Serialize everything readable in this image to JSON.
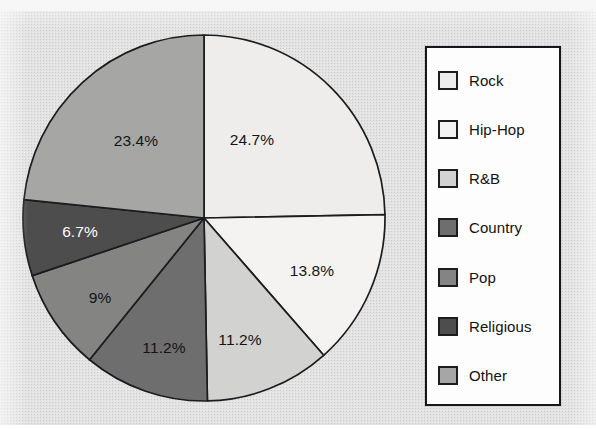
{
  "chart_data": {
    "type": "pie",
    "title": "",
    "legend_position": "right",
    "start_angle_deg": 0,
    "direction": "clockwise",
    "categories": [
      "Rock",
      "Hip-Hop",
      "R&B",
      "Country",
      "Pop",
      "Religious",
      "Other"
    ],
    "values": [
      24.7,
      13.8,
      11.2,
      11.2,
      9,
      6.7,
      23.4
    ],
    "slice_labels": [
      "24.7%",
      "13.8%",
      "11.2%",
      "11.2%",
      "9%",
      "6.7%",
      "23.4%"
    ],
    "slice_colors": [
      "#eeedec",
      "#f4f3f2",
      "#d2d2d1",
      "#6e6e6e",
      "#848483",
      "#4d4d4d",
      "#a6a6a5"
    ],
    "slice_label_colors": [
      "#141414",
      "#141414",
      "#141414",
      "#141414",
      "#141414",
      "#ffffff",
      "#141414"
    ],
    "units": "percent",
    "total": 100
  },
  "pie": {
    "slices": [
      {
        "name": "Rock",
        "label": "24.7%",
        "value": 24.7,
        "color": "#eeedec",
        "label_color": "dark",
        "label_x": 252,
        "label_y": 140
      },
      {
        "name": "Hip-Hop",
        "label": "13.8%",
        "value": 13.8,
        "color": "#f4f3f2",
        "label_color": "dark",
        "label_x": 312,
        "label_y": 271
      },
      {
        "name": "R&B",
        "label": "11.2%",
        "value": 11.2,
        "color": "#d2d2d1",
        "label_color": "dark",
        "label_x": 240,
        "label_y": 340
      },
      {
        "name": "Country",
        "label": "11.2%",
        "value": 11.2,
        "color": "#6e6e6e",
        "label_color": "dark",
        "label_x": 164,
        "label_y": 348
      },
      {
        "name": "Pop",
        "label": "9%",
        "value": 9,
        "color": "#848483",
        "label_color": "dark",
        "label_x": 100,
        "label_y": 298
      },
      {
        "name": "Religious",
        "label": "6.7%",
        "value": 6.7,
        "color": "#4d4d4d",
        "label_color": "light",
        "label_x": 80,
        "label_y": 232
      },
      {
        "name": "Other",
        "label": "23.4%",
        "value": 23.4,
        "color": "#a6a6a5",
        "label_color": "dark",
        "label_x": 136,
        "label_y": 141
      }
    ],
    "geometry": {
      "cx": 204,
      "cy": 218,
      "rx": 181,
      "ry": 183
    },
    "outline_color": "#1a1c1f"
  },
  "legend": {
    "items": [
      {
        "label": "Rock",
        "color": "#eeedec"
      },
      {
        "label": "Hip-Hop",
        "color": "#f4f3f2"
      },
      {
        "label": "R&B",
        "color": "#d2d2d1"
      },
      {
        "label": "Country",
        "color": "#6e6e6e"
      },
      {
        "label": "Pop",
        "color": "#848483"
      },
      {
        "label": "Religious",
        "color": "#4d4d4d"
      },
      {
        "label": "Other",
        "color": "#a6a6a5"
      }
    ],
    "border_color": "#15171a",
    "background_color": "#fdfdfd"
  }
}
